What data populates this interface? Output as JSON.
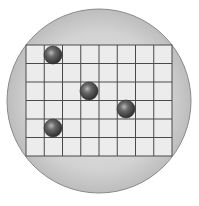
{
  "diagram": {
    "type": "petri-dish-grid",
    "plate": {
      "cx": 99,
      "cy": 101,
      "r": 92,
      "fill": "#d4d4d4",
      "edge": "#8a8a8a"
    },
    "grid": {
      "x": 26,
      "y": 45,
      "width": 146,
      "height": 111,
      "columns": 8,
      "rows": 6,
      "fill": "#ececec",
      "line_color": "#4a4a4a"
    },
    "spheres": [
      {
        "id": 1,
        "cx": 53,
        "cy": 55,
        "r": 9
      },
      {
        "id": 2,
        "cx": 89,
        "cy": 91,
        "r": 9
      },
      {
        "id": 3,
        "cx": 126,
        "cy": 109,
        "r": 9
      },
      {
        "id": 4,
        "cx": 53,
        "cy": 128,
        "r": 9
      }
    ],
    "sphere_color": "#3c3c3c"
  }
}
